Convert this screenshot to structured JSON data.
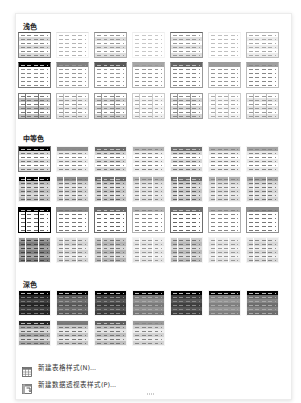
{
  "panel": {
    "sections": [
      {
        "title": "浅色",
        "count": 21
      },
      {
        "title": "中等色",
        "count": 28
      },
      {
        "title": "深色",
        "count": 11
      }
    ],
    "menu": [
      {
        "label": "新建表格样式(N)...",
        "icon": "new-table-style-icon"
      },
      {
        "label": "新建数据透视表样式(P)...",
        "icon": "new-pivot-style-icon"
      }
    ]
  },
  "styles": {
    "light": [
      {
        "header": "#ffffff",
        "band": "#d9d9d9",
        "body": "#ffffff",
        "dash": "#8a8a8a",
        "border": "#7f7f7f",
        "grid": false,
        "top": "#555"
      },
      {
        "header": "#ffffff",
        "band": "#ffffff",
        "body": "#ffffff",
        "dash": "#b5b5b5",
        "border": "#ffffff",
        "grid": false,
        "top": "#ddd"
      },
      {
        "header": "#ffffff",
        "band": "#dedede",
        "body": "#ffffff",
        "dash": "#999",
        "border": "#aaa",
        "grid": false,
        "top": "#888"
      },
      {
        "header": "#ffffff",
        "band": "#ffffff",
        "body": "#ffffff",
        "dash": "#c8c8c8",
        "border": "#ffffff",
        "grid": false,
        "top": "#eee"
      },
      {
        "header": "#ffffff",
        "band": "#e0e0e0",
        "body": "#ffffff",
        "dash": "#999",
        "border": "#999",
        "grid": false,
        "top": "#666"
      },
      {
        "header": "#ffffff",
        "band": "#ffffff",
        "body": "#ffffff",
        "dash": "#c0c0c0",
        "border": "#ffffff",
        "grid": false,
        "top": "#eee"
      },
      {
        "header": "#ffffff",
        "band": "#ececec",
        "body": "#ffffff",
        "dash": "#aaa",
        "border": "#bbb",
        "grid": false,
        "top": "#bbb"
      },
      {
        "header": "#000000",
        "band": "#ffffff",
        "body": "#ffffff",
        "dash": "#888",
        "border": "#777",
        "grid": false,
        "top": "#000"
      },
      {
        "header": "#7f7f7f",
        "band": "#ffffff",
        "body": "#ffffff",
        "dash": "#999",
        "border": "#bbb",
        "grid": false,
        "top": "#7f7f7f"
      },
      {
        "header": "#595959",
        "band": "#ffffff",
        "body": "#ffffff",
        "dash": "#999",
        "border": "#999",
        "grid": false,
        "top": "#595959"
      },
      {
        "header": "#a6a6a6",
        "band": "#ffffff",
        "body": "#ffffff",
        "dash": "#999",
        "border": "#bbb",
        "grid": false,
        "top": "#a6a6a6"
      },
      {
        "header": "#666666",
        "band": "#ffffff",
        "body": "#ffffff",
        "dash": "#888",
        "border": "#999",
        "grid": false,
        "top": "#666"
      },
      {
        "header": "#9c9c9c",
        "band": "#ffffff",
        "body": "#ffffff",
        "dash": "#999",
        "border": "#bbb",
        "grid": false,
        "top": "#9c9c9c"
      },
      {
        "header": "#a0a0a0",
        "band": "#ffffff",
        "body": "#ffffff",
        "dash": "#888",
        "border": "#bbb",
        "grid": false,
        "top": "#a0a0a0"
      },
      {
        "header": "#ffffff",
        "band": "#bfbfbf",
        "body": "#ffffff",
        "dash": "#777",
        "border": "#777",
        "grid": true,
        "top": "#777"
      },
      {
        "header": "#ffffff",
        "band": "#e6e6e6",
        "body": "#ffffff",
        "dash": "#999",
        "border": "#bbb",
        "grid": true,
        "top": "#bbb"
      },
      {
        "header": "#ffffff",
        "band": "#d0d0d0",
        "body": "#ffffff",
        "dash": "#888",
        "border": "#999",
        "grid": true,
        "top": "#999"
      },
      {
        "header": "#ffffff",
        "band": "#f0f0f0",
        "body": "#ffffff",
        "dash": "#aaa",
        "border": "#ccc",
        "grid": true,
        "top": "#ccc"
      },
      {
        "header": "#ffffff",
        "band": "#d5d5d5",
        "body": "#ffffff",
        "dash": "#888",
        "border": "#999",
        "grid": true,
        "top": "#999"
      },
      {
        "header": "#ffffff",
        "band": "#f2f2f2",
        "body": "#ffffff",
        "dash": "#aaa",
        "border": "#ccc",
        "grid": true,
        "top": "#ccc"
      },
      {
        "header": "#ffffff",
        "band": "#e3e3e3",
        "body": "#ffffff",
        "dash": "#999",
        "border": "#bbb",
        "grid": true,
        "top": "#bbb"
      }
    ],
    "medium": [
      {
        "header": "#000000",
        "band": "#d9d9d9",
        "body": "#ffffff",
        "dash": "#777",
        "border": "#777",
        "grid": false
      },
      {
        "header": "#8c8c8c",
        "band": "#e6e6e6",
        "body": "#ffffff",
        "dash": "#888",
        "border": "#fff",
        "grid": false
      },
      {
        "header": "#6b6b6b",
        "band": "#d5d5d5",
        "body": "#ffffff",
        "dash": "#777",
        "border": "#fff",
        "grid": false
      },
      {
        "header": "#b3b3b3",
        "band": "#ececec",
        "body": "#ffffff",
        "dash": "#888",
        "border": "#fff",
        "grid": false
      },
      {
        "header": "#6e6e6e",
        "band": "#d8d8d8",
        "body": "#ffffff",
        "dash": "#777",
        "border": "#fff",
        "grid": false
      },
      {
        "header": "#b0b0b0",
        "band": "#ebebeb",
        "body": "#ffffff",
        "dash": "#888",
        "border": "#fff",
        "grid": false
      },
      {
        "header": "#a5a5a5",
        "band": "#e8e8e8",
        "body": "#ffffff",
        "dash": "#888",
        "border": "#fff",
        "grid": false
      },
      {
        "header": "#000000",
        "band": "#bfbfbf",
        "body": "#d9d9d9",
        "dash": "#666",
        "border": "#fff",
        "grid": true
      },
      {
        "header": "#8c8c8c",
        "band": "#cfcfcf",
        "body": "#e6e6e6",
        "dash": "#777",
        "border": "#fff",
        "grid": true
      },
      {
        "header": "#6b6b6b",
        "band": "#c4c4c4",
        "body": "#dedede",
        "dash": "#666",
        "border": "#fff",
        "grid": true
      },
      {
        "header": "#b3b3b3",
        "band": "#dcdcdc",
        "body": "#ececec",
        "dash": "#888",
        "border": "#fff",
        "grid": true
      },
      {
        "header": "#6e6e6e",
        "band": "#c6c6c6",
        "body": "#dfdfdf",
        "dash": "#666",
        "border": "#fff",
        "grid": true
      },
      {
        "header": "#b0b0b0",
        "band": "#dadada",
        "body": "#ebebeb",
        "dash": "#888",
        "border": "#fff",
        "grid": true
      },
      {
        "header": "#a5a5a5",
        "band": "#d6d6d6",
        "body": "#e8e8e8",
        "dash": "#777",
        "border": "#fff",
        "grid": true
      },
      {
        "header": "#000000",
        "band": "#ffffff",
        "body": "#ffffff",
        "dash": "#666",
        "border": "#000",
        "grid": true
      },
      {
        "header": "#8c8c8c",
        "band": "#ffffff",
        "body": "#ffffff",
        "dash": "#777",
        "border": "#8c8c8c",
        "grid": false
      },
      {
        "header": "#6b6b6b",
        "band": "#ffffff",
        "body": "#ffffff",
        "dash": "#666",
        "border": "#6b6b6b",
        "grid": false
      },
      {
        "header": "#b3b3b3",
        "band": "#ffffff",
        "body": "#ffffff",
        "dash": "#888",
        "border": "#b3b3b3",
        "grid": false
      },
      {
        "header": "#6e6e6e",
        "band": "#ffffff",
        "body": "#ffffff",
        "dash": "#666",
        "border": "#6e6e6e",
        "grid": false
      },
      {
        "header": "#b0b0b0",
        "band": "#ffffff",
        "body": "#ffffff",
        "dash": "#888",
        "border": "#b0b0b0",
        "grid": false
      },
      {
        "header": "#8f8f8f",
        "band": "#ffffff",
        "body": "#ffffff",
        "dash": "#777",
        "border": "#8f8f8f",
        "grid": false
      },
      {
        "header": "#9a9a9a",
        "band": "#7f7f7f",
        "body": "#a6a6a6",
        "dash": "#444",
        "border": "#fff",
        "grid": true
      },
      {
        "header": "#e0e0e0",
        "band": "#d3d3d3",
        "body": "#eeeeee",
        "dash": "#888",
        "border": "#fff",
        "grid": true
      },
      {
        "header": "#c8c8c8",
        "band": "#b7b7b7",
        "body": "#d9d9d9",
        "dash": "#777",
        "border": "#fff",
        "grid": true
      },
      {
        "header": "#eeeeee",
        "band": "#e2e2e2",
        "body": "#f3f3f3",
        "dash": "#999",
        "border": "#fff",
        "grid": true
      },
      {
        "header": "#cccccc",
        "band": "#bcbcbc",
        "body": "#dcdcdc",
        "dash": "#777",
        "border": "#fff",
        "grid": true
      },
      {
        "header": "#ececec",
        "band": "#e0e0e0",
        "body": "#f2f2f2",
        "dash": "#999",
        "border": "#fff",
        "grid": true
      },
      {
        "header": "#e6e6e6",
        "band": "#d8d8d8",
        "body": "#efefef",
        "dash": "#888",
        "border": "#fff",
        "grid": true
      }
    ],
    "dark": [
      {
        "header": "#000000",
        "band": "#262626",
        "body": "#404040",
        "dash": "#777",
        "border": "#fff",
        "grid": false
      },
      {
        "header": "#000000",
        "band": "#595959",
        "body": "#6e6e6e",
        "dash": "#999",
        "border": "#fff",
        "grid": false
      },
      {
        "header": "#000000",
        "band": "#3d3d3d",
        "body": "#555555",
        "dash": "#888",
        "border": "#fff",
        "grid": false
      },
      {
        "header": "#000000",
        "band": "#7a7a7a",
        "body": "#909090",
        "dash": "#aaa",
        "border": "#fff",
        "grid": false
      },
      {
        "header": "#000000",
        "band": "#3f3f3f",
        "body": "#565656",
        "dash": "#888",
        "border": "#fff",
        "grid": false
      },
      {
        "header": "#000000",
        "band": "#808080",
        "body": "#959595",
        "dash": "#aaa",
        "border": "#fff",
        "grid": false
      },
      {
        "header": "#000000",
        "band": "#6e6e6e",
        "body": "#858585",
        "dash": "#aaa",
        "border": "#fff",
        "grid": false
      },
      {
        "header": "#262626",
        "band": "#a6a6a6",
        "body": "#d9d9d9",
        "dash": "#666",
        "border": "#fff",
        "grid": false
      },
      {
        "header": "#7a7a7a",
        "band": "#c8c8c8",
        "body": "#ebebeb",
        "dash": "#777",
        "border": "#fff",
        "grid": false
      },
      {
        "header": "#5f5f5f",
        "band": "#c0c0c0",
        "body": "#e4e4e4",
        "dash": "#777",
        "border": "#fff",
        "grid": false
      },
      {
        "header": "#9a9a9a",
        "band": "#d3d3d3",
        "body": "#eeeeee",
        "dash": "#888",
        "border": "#fff",
        "grid": false
      }
    ]
  }
}
